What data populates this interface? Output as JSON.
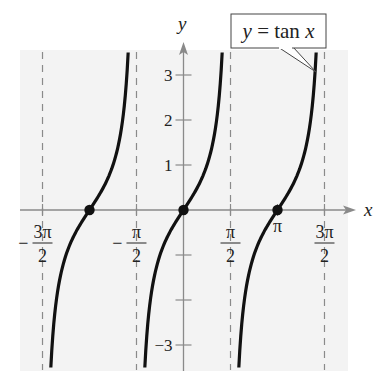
{
  "chart_data": {
    "type": "line",
    "title": "",
    "function_label": "y = tan x",
    "xlabel": "x",
    "ylabel": "y",
    "xlim": [
      -5.2,
      5.4
    ],
    "ylim": [
      -3.5,
      3.5
    ],
    "x_ticks": [
      {
        "value": -4.712,
        "num": "3π",
        "den": "2",
        "neg": true
      },
      {
        "value": -1.571,
        "num": "π",
        "den": "2",
        "neg": true
      },
      {
        "value": 1.571,
        "num": "π",
        "den": "2",
        "neg": false
      },
      {
        "value": 3.1416,
        "num": "π",
        "den": "",
        "neg": false
      },
      {
        "value": 4.712,
        "num": "3π",
        "den": "2",
        "neg": false
      }
    ],
    "y_ticks": [
      {
        "value": 3,
        "label": "3"
      },
      {
        "value": 2,
        "label": "2"
      },
      {
        "value": 1,
        "label": "1"
      },
      {
        "value": -1,
        "label": ""
      },
      {
        "value": -2,
        "label": ""
      },
      {
        "value": -3,
        "label": "−3"
      }
    ],
    "asymptotes": [
      -4.712,
      -1.571,
      1.571,
      4.712
    ],
    "zeros": [
      -3.1416,
      0,
      3.1416
    ],
    "branches": [
      {
        "center": -3.1416
      },
      {
        "center": 0
      },
      {
        "center": 3.1416
      }
    ],
    "grid": false,
    "legend": "callout box upper right",
    "colors": {
      "panel": "#f3f3f3",
      "axis": "#8a8a8a",
      "curve": "#111111",
      "asymptote": "#8a8a8a"
    }
  },
  "labels": {
    "y_axis": "y",
    "x_axis": "x",
    "callout": "y = tan x"
  }
}
